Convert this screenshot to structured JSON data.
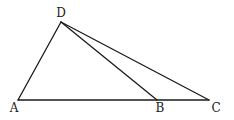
{
  "diagram": {
    "type": "geometry-triangle",
    "points": {
      "A": {
        "label": "A",
        "x": 18,
        "y": 100,
        "lx": 14,
        "ly": 112
      },
      "B": {
        "label": "B",
        "x": 157,
        "y": 100,
        "lx": 160,
        "ly": 112
      },
      "C": {
        "label": "C",
        "x": 209,
        "y": 100,
        "lx": 216,
        "ly": 112
      },
      "D": {
        "label": "D",
        "x": 61,
        "y": 22,
        "lx": 61,
        "ly": 17
      }
    },
    "segments": [
      [
        "A",
        "D"
      ],
      [
        "A",
        "C"
      ],
      [
        "D",
        "B"
      ],
      [
        "D",
        "C"
      ]
    ]
  }
}
